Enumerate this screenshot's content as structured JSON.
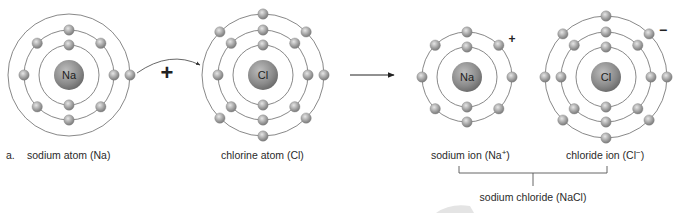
{
  "diagram": {
    "part_label": "a.",
    "operator_plus": "+",
    "atoms": [
      {
        "id": "sodium-atom",
        "symbol": "Na",
        "caption": "sodium atom (Na)",
        "shells": [
          2,
          8,
          1
        ],
        "charge": ""
      },
      {
        "id": "chlorine-atom",
        "symbol": "Cl",
        "caption": "chlorine atom (Cl)",
        "shells": [
          2,
          8,
          7
        ],
        "charge": ""
      },
      {
        "id": "sodium-ion",
        "symbol": "Na",
        "caption": "sodium ion (Na",
        "caption_sup": "+",
        "caption_end": ")",
        "shells": [
          2,
          8
        ],
        "charge": "+"
      },
      {
        "id": "chloride-ion",
        "symbol": "Cl",
        "caption": "chloride ion (Cl",
        "caption_sup": "−",
        "caption_end": ")",
        "shells": [
          2,
          8,
          8
        ],
        "charge": "−"
      }
    ],
    "product_label": "sodium chloride (NaCl)",
    "colors": {
      "nucleus": "#8c8c8c",
      "electron": "#a9a9a9",
      "shell": "#7a7a7a",
      "text": "#2a2a2a"
    }
  }
}
